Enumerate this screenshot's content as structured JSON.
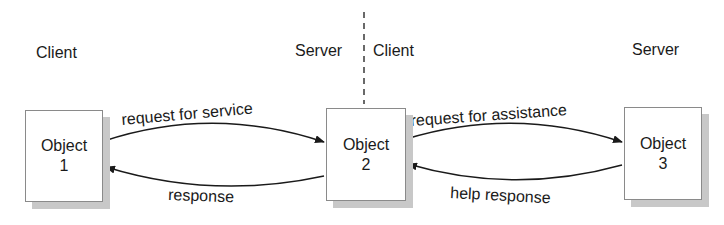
{
  "diagram": {
    "roles": {
      "client_left": "Client",
      "server_middle": "Server",
      "client_middle": "Client",
      "server_right": "Server"
    },
    "objects": [
      {
        "line1": "Object",
        "line2": "1"
      },
      {
        "line1": "Object",
        "line2": "2"
      },
      {
        "line1": "Object",
        "line2": "3"
      }
    ],
    "arrows": {
      "o1_to_o2": "request for service",
      "o2_to_o1": "response",
      "o2_to_o3": "request for assistance",
      "o3_to_o2": "help response"
    },
    "colors": {
      "ink": "#1a1a1a",
      "box_border": "#8a8a8a",
      "shadow": "#c8c8c8"
    }
  }
}
